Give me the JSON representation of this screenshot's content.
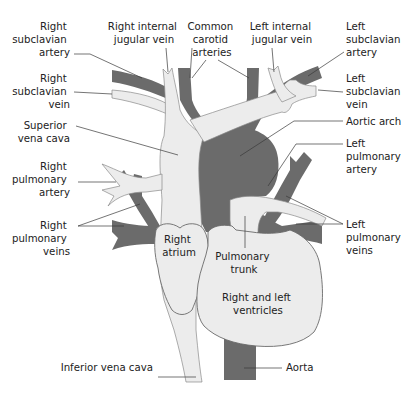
{
  "diagram": {
    "colors": {
      "artery": "#6b6b6b",
      "vein": "#ececec",
      "outline": "#6a6a6a",
      "text": "#222222",
      "background": "#ffffff"
    },
    "labels": {
      "right_subclavian_artery": [
        "Right",
        "subclavian",
        "artery"
      ],
      "right_internal_jugular_vein": [
        "Right internal",
        "jugular vein"
      ],
      "common_carotid_arteries": [
        "Common",
        "carotid",
        "arteries"
      ],
      "left_internal_jugular_vein": [
        "Left internal",
        "jugular vein"
      ],
      "left_subclavian_artery": [
        "Left",
        "subclavian",
        "artery"
      ],
      "right_subclavian_vein": [
        "Right",
        "subclavian",
        "vein"
      ],
      "left_subclavian_vein": [
        "Left",
        "subclavian",
        "vein"
      ],
      "superior_vena_cava": [
        "Superior",
        "vena cava"
      ],
      "aortic_arch": [
        "Aortic arch"
      ],
      "left_pulmonary_artery": [
        "Left",
        "pulmonary",
        "artery"
      ],
      "right_pulmonary_artery": [
        "Right",
        "pulmonary",
        "artery"
      ],
      "right_pulmonary_veins": [
        "Right",
        "pulmonary",
        "veins"
      ],
      "left_pulmonary_veins": [
        "Left",
        "pulmonary",
        "veins"
      ],
      "right_atrium": [
        "Right",
        "atrium"
      ],
      "pulmonary_trunk": [
        "Pulmonary",
        "trunk"
      ],
      "ventricles": [
        "Right and left",
        "ventricles"
      ],
      "inferior_vena_cava": [
        "Inferior vena cava"
      ],
      "aorta": [
        "Aorta"
      ]
    }
  }
}
